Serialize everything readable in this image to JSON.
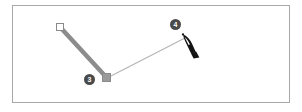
{
  "app": {
    "surface": "vector-drawing-artboard",
    "background_color": "#ffffff",
    "frame_border_color": "#a8a8a8"
  },
  "artboard": {
    "x": 12,
    "y": 5,
    "width": 278,
    "height": 98
  },
  "path": {
    "name": "open-polyline-path",
    "stroke_color_segment_1": "#8c8c8c",
    "stroke_color_segment_2": "#b5b5b5",
    "segments": [
      {
        "name": "drawn-segment",
        "from": [
          60,
          27
        ],
        "to": [
          107,
          78
        ],
        "stroke_width": 4.5,
        "color": "#8c8c8c"
      },
      {
        "name": "rubber-band-preview-segment",
        "from": [
          107,
          78
        ],
        "to": [
          185,
          38
        ],
        "stroke_width": 1,
        "color": "#b5b5b5"
      }
    ]
  },
  "anchors": [
    {
      "name": "start-anchor-point",
      "style": "hollow-square",
      "x": 60,
      "y": 27,
      "fill": "#ffffff",
      "stroke": "#8a8a8a"
    },
    {
      "name": "corner-anchor-point",
      "style": "filled-square",
      "x": 107,
      "y": 78,
      "fill": "#9a9a9a",
      "stroke": "#8a8a8a"
    }
  ],
  "callouts": [
    {
      "name": "step-badge-3",
      "label": "3",
      "target": "corner-anchor-point"
    },
    {
      "name": "step-badge-4",
      "label": "4",
      "target": "pen-tool-cursor"
    }
  ],
  "cursor": {
    "name": "pen-tool-cursor",
    "icon": "pen-nib-icon",
    "x": 185,
    "y": 38,
    "color": "#141414"
  }
}
